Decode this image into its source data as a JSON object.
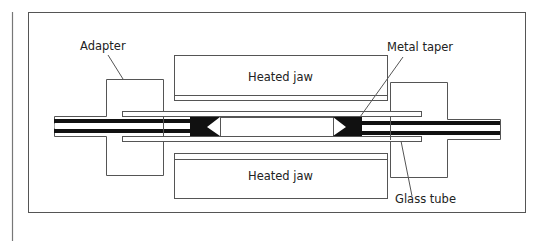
{
  "diagram": {
    "title": "",
    "labels": {
      "adapter": "Adapter",
      "metal_taper": "Metal taper",
      "heated_jaw_top": "Heated jaw",
      "heated_jaw_bottom": "Heated jaw",
      "glass_tube": "Glass tube"
    },
    "colors": {
      "line": "#555555",
      "fill_dark": "#111111",
      "background": "#ffffff"
    }
  }
}
